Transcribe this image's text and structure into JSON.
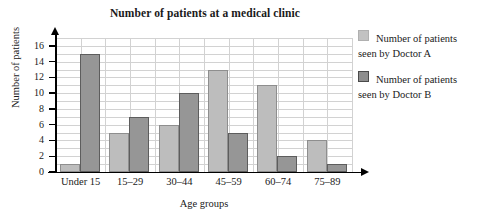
{
  "chart_data": {
    "type": "bar",
    "title": "Number of patients at a medical clinic",
    "xlabel": "Age groups",
    "ylabel": "Number of patients",
    "categories": [
      "Under 15",
      "15–29",
      "30–44",
      "45–59",
      "60–74",
      "75–89"
    ],
    "series": [
      {
        "name": "Number of patients seen by Doctor A",
        "name_line1": "Number of patients",
        "name_line2": "seen by Doctor A",
        "color": "#bdbdbd",
        "values": [
          1,
          5,
          6,
          13,
          11,
          4
        ]
      },
      {
        "name": "Number of patients seen by Doctor B",
        "name_line1": "Number of patients",
        "name_line2": "seen by Doctor B",
        "color": "#969696",
        "values": [
          15,
          7,
          10,
          5,
          2,
          1
        ]
      }
    ],
    "ylim": [
      0,
      17
    ],
    "yticks": [
      0,
      2,
      4,
      6,
      8,
      10,
      12,
      14,
      16
    ],
    "ytick_labels": [
      "0",
      "2",
      "4",
      "6",
      "8",
      "10",
      "12",
      "14",
      "16"
    ],
    "grid": true,
    "grid_step": 1,
    "legend_position": "right",
    "legend_entries": [
      "Number of patients seen by Doctor A",
      "Number of patients seen by Doctor B"
    ]
  },
  "colors": {
    "series_a": "#bdbdbd",
    "series_b": "#969696",
    "grid": "#d2d2d2",
    "axis": "#000000",
    "background": "#ffffff"
  }
}
